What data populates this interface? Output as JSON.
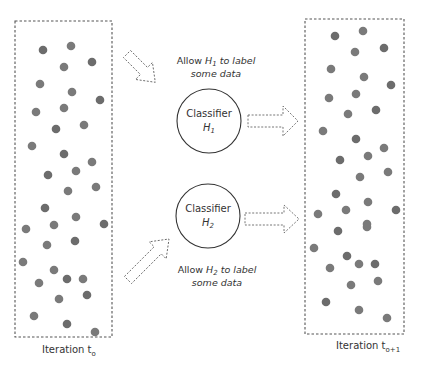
{
  "colors": {
    "dot": "#7a7a7a",
    "dot_dark": "#6c6c6c",
    "border": "#555555",
    "text": "#333333"
  },
  "left_panel": {
    "label_main": "Iteration t",
    "label_sub": "o",
    "box": {
      "x": 15,
      "y": 21,
      "w": 97,
      "h": 316
    },
    "dots": [
      [
        43,
        50
      ],
      [
        71,
        46
      ],
      [
        64,
        67
      ],
      [
        92,
        62
      ],
      [
        40,
        84
      ],
      [
        72,
        92
      ],
      [
        100,
        100
      ],
      [
        64,
        108
      ],
      [
        36,
        112
      ],
      [
        56,
        129
      ],
      [
        84,
        125
      ],
      [
        32,
        146
      ],
      [
        64,
        154
      ],
      [
        92,
        162
      ],
      [
        76,
        171
      ],
      [
        48,
        175
      ],
      [
        68,
        191
      ],
      [
        96,
        187
      ],
      [
        45,
        208
      ],
      [
        76,
        217
      ],
      [
        54,
        225
      ],
      [
        104,
        224
      ],
      [
        26,
        229
      ],
      [
        47,
        245
      ],
      [
        75,
        241
      ],
      [
        23,
        262
      ],
      [
        54,
        270
      ],
      [
        67,
        279
      ],
      [
        83,
        279
      ],
      [
        39,
        283
      ],
      [
        87,
        295
      ],
      [
        59,
        299
      ],
      [
        34,
        316
      ],
      [
        67,
        324
      ],
      [
        95,
        332
      ]
    ]
  },
  "right_panel": {
    "label_main": "Iteration t",
    "label_sub": "o+1",
    "box": {
      "x": 305,
      "y": 19,
      "w": 99,
      "h": 315
    },
    "dots": [
      [
        335,
        36
      ],
      [
        363,
        31
      ],
      [
        355,
        52
      ],
      [
        384,
        48
      ],
      [
        331,
        69
      ],
      [
        364,
        77
      ],
      [
        391,
        85
      ],
      [
        356,
        94
      ],
      [
        329,
        98
      ],
      [
        376,
        110
      ],
      [
        348,
        114
      ],
      [
        323,
        131
      ],
      [
        356,
        139
      ],
      [
        384,
        148
      ],
      [
        368,
        156
      ],
      [
        340,
        160
      ],
      [
        388,
        172
      ],
      [
        360,
        177
      ],
      [
        336,
        194
      ],
      [
        368,
        202
      ],
      [
        346,
        210
      ],
      [
        396,
        210
      ],
      [
        318,
        214
      ],
      [
        367,
        224
      ],
      [
        338,
        231
      ],
      [
        367,
        227
      ],
      [
        314,
        248
      ],
      [
        347,
        256
      ],
      [
        330,
        268
      ],
      [
        359,
        264
      ],
      [
        375,
        264
      ],
      [
        378,
        281
      ],
      [
        351,
        285
      ],
      [
        326,
        302
      ],
      [
        359,
        310
      ],
      [
        387,
        318
      ]
    ]
  },
  "classifiers": [
    {
      "id": "h1",
      "label": "Classifier",
      "h_main": "H",
      "h_sub": "1",
      "cx": 209,
      "cy": 121,
      "r": 32
    },
    {
      "id": "h2",
      "label": "Classifier",
      "h_main": "H",
      "h_sub": "2",
      "cx": 208,
      "cy": 216,
      "r": 32
    }
  ],
  "annotations": [
    {
      "id": "allow-h1",
      "line1_pre": "Allow ",
      "h_main": "H",
      "h_sub": "1",
      "line1_post": " to label",
      "line2": "some data",
      "x": 216,
      "y1": 62,
      "y2": 75
    },
    {
      "id": "allow-h2",
      "line1_pre": "Allow ",
      "h_main": "H",
      "h_sub": "2",
      "line1_post": " to label",
      "line2": "some data",
      "x": 217,
      "y1": 271,
      "y2": 284
    }
  ],
  "arrows": [
    {
      "id": "data-to-h1",
      "direction": "down-right"
    },
    {
      "id": "data-to-h2",
      "direction": "up-right"
    },
    {
      "id": "h1-to-next",
      "direction": "right"
    },
    {
      "id": "h2-to-next",
      "direction": "right"
    }
  ]
}
